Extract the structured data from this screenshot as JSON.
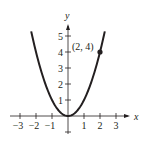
{
  "chart_data": {
    "type": "line",
    "title": "",
    "function": "y = x^2",
    "xlabel": "x",
    "ylabel": "y",
    "xlim": [
      -3.3,
      4
    ],
    "ylim": [
      -1,
      6
    ],
    "x_ticks": [
      -3,
      -2,
      -1,
      1,
      2,
      3
    ],
    "x_tick_labels": [
      "−3",
      "−2",
      "−1",
      "1",
      "2",
      "3"
    ],
    "y_ticks": [
      1,
      2,
      3,
      4,
      5
    ],
    "y_tick_labels": [
      "1",
      "2",
      "3",
      "4",
      "5"
    ],
    "grid": false,
    "series": [
      {
        "name": "parabola",
        "x": [
          -2.3,
          -2,
          -1.5,
          -1,
          -0.5,
          0,
          0.5,
          1,
          1.5,
          2,
          2.3
        ],
        "y": [
          5.29,
          4,
          2.25,
          1,
          0.25,
          0,
          0.25,
          1,
          2.25,
          4,
          5.29
        ]
      }
    ],
    "annotations": [
      {
        "point": [
          2,
          4
        ],
        "label": "(2, 4)",
        "marker": "filled-circle"
      }
    ],
    "colors": {
      "curve": "#231f20",
      "axes": "#231f20"
    }
  }
}
